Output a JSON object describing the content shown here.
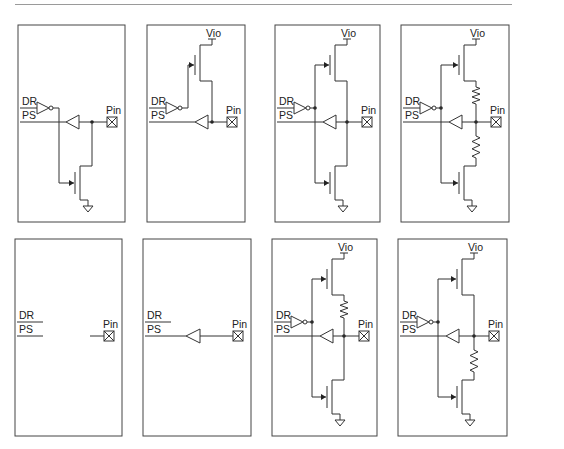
{
  "figure": {
    "labels": {
      "dr": "DR",
      "ps": "PS",
      "pin": "Pin",
      "vio": "Vio"
    },
    "colors": {
      "line": "#333333",
      "box": "#444444",
      "rule": "#9a9a9a"
    },
    "panels": [
      {
        "id": "a",
        "row": 0,
        "x": 18,
        "y": 25,
        "w": 107,
        "h": 197,
        "pullup": false,
        "pulldown": true,
        "res_up": false,
        "res_down": false,
        "driver": true,
        "receiver": true
      },
      {
        "id": "b",
        "row": 0,
        "x": 147,
        "y": 25,
        "w": 98,
        "h": 197,
        "pullup": true,
        "pulldown": false,
        "res_up": false,
        "res_down": false,
        "driver": true,
        "receiver": true
      },
      {
        "id": "c",
        "row": 0,
        "x": 275,
        "y": 25,
        "w": 105,
        "h": 197,
        "pullup": true,
        "pulldown": true,
        "res_up": false,
        "res_down": false,
        "driver": true,
        "receiver": true
      },
      {
        "id": "d",
        "row": 0,
        "x": 401,
        "y": 25,
        "w": 108,
        "h": 197,
        "pullup": true,
        "pulldown": true,
        "res_up": true,
        "res_down": true,
        "driver": true,
        "receiver": true
      },
      {
        "id": "e",
        "row": 1,
        "x": 15,
        "y": 239,
        "w": 107,
        "h": 197,
        "pullup": false,
        "pulldown": false,
        "res_up": false,
        "res_down": false,
        "driver": false,
        "receiver": false
      },
      {
        "id": "f",
        "row": 1,
        "x": 143,
        "y": 239,
        "w": 108,
        "h": 197,
        "pullup": false,
        "pulldown": false,
        "res_up": false,
        "res_down": false,
        "driver": false,
        "receiver": true
      },
      {
        "id": "g",
        "row": 1,
        "x": 272,
        "y": 239,
        "w": 105,
        "h": 197,
        "pullup": true,
        "pulldown": true,
        "res_up": true,
        "res_down": false,
        "driver": true,
        "receiver": true
      },
      {
        "id": "h",
        "row": 1,
        "x": 398,
        "y": 239,
        "w": 109,
        "h": 197,
        "pullup": true,
        "pulldown": true,
        "res_up": false,
        "res_down": true,
        "driver": true,
        "receiver": true
      }
    ]
  }
}
